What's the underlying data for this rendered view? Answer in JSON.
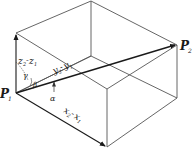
{
  "diagram": {
    "points": {
      "p1": {
        "label": "P",
        "sub": "1"
      },
      "p2": {
        "label": "P",
        "sub": "2"
      }
    },
    "edges_labels": {
      "z": {
        "a": "z",
        "a_sub": "2",
        "sep": "-",
        "b": "z",
        "b_sub": "1"
      },
      "y": {
        "a": "y",
        "a_sub": "2",
        "sep": "-",
        "b": "y",
        "b_sub": "1"
      },
      "x": {
        "a": "x",
        "a_sub": "2",
        "sep": "-",
        "b": "x",
        "b_sub": "1"
      }
    },
    "angles": {
      "alpha": "α",
      "beta": "β",
      "gamma": "γ"
    },
    "colors": {
      "edge": "#555555",
      "vector": "#1a1a1a",
      "background": "#ffffff"
    }
  }
}
